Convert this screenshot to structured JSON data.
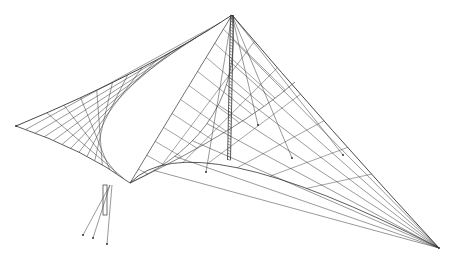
{
  "figure": {
    "stroke_color": "#333333",
    "background": "#ffffff",
    "mast": {
      "top": [
        232,
        15
      ],
      "bottom": [
        229,
        160
      ],
      "foot_post": [
        [
          103,
          185
        ],
        [
          106,
          215
        ]
      ]
    },
    "corners": {
      "left_tip": [
        16,
        126
      ],
      "right_tip": [
        439,
        248
      ],
      "front_foot": [
        108,
        192
      ]
    },
    "anchors": [
      [
        23,
        251
      ],
      [
        33,
        258
      ],
      [
        47,
        263
      ],
      [
        206,
        172
      ],
      [
        292,
        158
      ],
      [
        343,
        155
      ],
      [
        258,
        125
      ]
    ]
  }
}
